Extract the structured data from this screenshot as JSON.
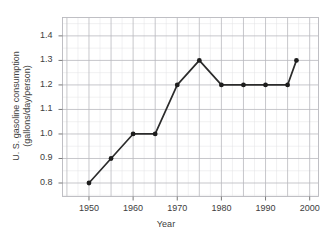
{
  "chart_data": {
    "type": "line",
    "title": "",
    "xlabel": "Year",
    "ylabel_line1": "U. S. gasoline consumption",
    "ylabel_line2": "(gallons/day/person)",
    "x": [
      1950,
      1955,
      1960,
      1965,
      1970,
      1975,
      1980,
      1985,
      1990,
      1995,
      1997
    ],
    "values": [
      0.8,
      0.9,
      1.0,
      1.0,
      1.2,
      1.3,
      1.2,
      1.2,
      1.2,
      1.2,
      1.3
    ],
    "series": [
      {
        "name": "U.S. gasoline consumption",
        "values": [
          0.8,
          0.9,
          1.0,
          1.0,
          1.2,
          1.3,
          1.2,
          1.2,
          1.2,
          1.2,
          1.3
        ]
      }
    ],
    "xlim": [
      1944,
      2002
    ],
    "ylim": [
      0.745,
      1.475
    ],
    "xticks": [
      1950,
      1960,
      1970,
      1980,
      1990,
      2000
    ],
    "xtick_labels": [
      "1950",
      "1960",
      "1970",
      "1980",
      "1990",
      "2000"
    ],
    "yticks": [
      0.8,
      0.9,
      1.0,
      1.1,
      1.2,
      1.3,
      1.4
    ],
    "ytick_labels": [
      "0.8",
      "0.9",
      "1.0",
      "1.1",
      "1.2",
      "1.3",
      "1.4"
    ],
    "grid": true,
    "grid_major_x_step": 5,
    "grid_major_y_step": 0.1,
    "grid_minor_x_step": 2.5,
    "grid_minor_y_step": 0.05,
    "legend": null,
    "marker": "circle",
    "line_color": "#2b2b2b",
    "marker_color": "#1d1d1d",
    "grid_color_major": "#b9b9be",
    "grid_color_minor": "#e2e2e4",
    "background_color": "#ffffff",
    "text_color": "#3d3d3d"
  }
}
